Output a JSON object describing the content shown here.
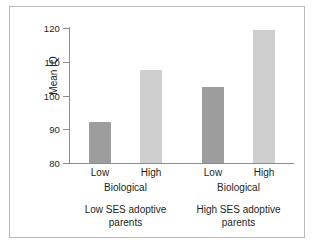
{
  "chart_data": {
    "type": "bar",
    "title": "",
    "xlabel": "",
    "ylabel": "Mean IQ",
    "ylim": [
      80,
      120
    ],
    "yticks": [
      80,
      90,
      100,
      110,
      120
    ],
    "ytick_labels": [
      "80",
      "90",
      "100",
      "110",
      "120"
    ],
    "grid": false,
    "legend": "none",
    "categories": [
      "Low",
      "High",
      "Low",
      "High"
    ],
    "values": [
      92.3,
      107.5,
      102.5,
      119.5
    ],
    "bar_colors": [
      "#9d9d9d",
      "#cfcfcf",
      "#9d9d9d",
      "#cfcfcf"
    ],
    "bars": [
      {
        "label": "Low",
        "value": 92.3,
        "color": "#9d9d9d",
        "group": "Biological",
        "panel": "Low SES adoptive parents"
      },
      {
        "label": "High",
        "value": 107.5,
        "color": "#cfcfcf",
        "group": "Biological",
        "panel": "Low SES adoptive parents"
      },
      {
        "label": "Low",
        "value": 102.5,
        "color": "#9d9d9d",
        "group": "Biological",
        "panel": "High SES adoptive parents"
      },
      {
        "label": "High",
        "value": 119.5,
        "color": "#cfcfcf",
        "group": "Biological",
        "panel": "High SES adoptive parents"
      }
    ],
    "group_labels": [
      "Biological",
      "Biological"
    ],
    "panel_labels": [
      "Low SES adoptive\nparents",
      "High SES adoptive\nparents"
    ]
  },
  "axis": {
    "y_label": "Mean IQ",
    "ticks": [
      {
        "value": 120,
        "label": "120"
      },
      {
        "value": 110,
        "label": "110"
      },
      {
        "value": 100,
        "label": "100"
      },
      {
        "value": 90,
        "label": "90"
      },
      {
        "value": 80,
        "label": "80"
      }
    ]
  },
  "x_tick_labels": [
    "Low",
    "High",
    "Low",
    "High"
  ],
  "group_labels": [
    "Biological",
    "Biological"
  ],
  "panels": [
    {
      "line1": "Low SES adoptive",
      "line2": "parents"
    },
    {
      "line1": "High SES adoptive",
      "line2": "parents"
    }
  ],
  "colors": {
    "bar_dark": "#9d9d9d",
    "bar_light": "#cfcfcf",
    "axis": "#8c8c8c",
    "frame": "#b9b9b9",
    "text": "#231f20",
    "background": "#ffffff"
  }
}
